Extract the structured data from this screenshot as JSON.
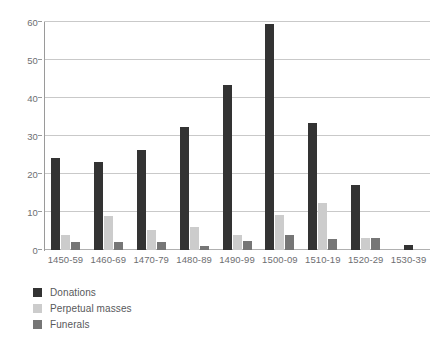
{
  "chart_data": {
    "type": "bar",
    "title": "",
    "subtitle": "",
    "xlabel": "",
    "ylabel": "",
    "categories": [
      "1450-59",
      "1460-69",
      "1470-79",
      "1480-89",
      "1490-99",
      "1500-09",
      "1510-19",
      "1520-29",
      "1530-39"
    ],
    "series": [
      {
        "name": "Donations",
        "color": "#333333",
        "values": [
          24.3,
          23.2,
          26.3,
          32.3,
          43.5,
          59.5,
          33.5,
          17.2,
          1.2
        ]
      },
      {
        "name": "Perpetual masses",
        "color": "#cccccc",
        "values": [
          4.0,
          9.0,
          5.3,
          6.0,
          4.0,
          9.3,
          12.3,
          3.2,
          0
        ]
      },
      {
        "name": "Funerals",
        "color": "#767676",
        "values": [
          2.0,
          2.0,
          2.0,
          1.0,
          2.3,
          4.0,
          3.0,
          3.2,
          0
        ]
      }
    ],
    "ylim": [
      0,
      60
    ],
    "yticks": [
      0,
      10,
      20,
      30,
      40,
      50,
      60
    ],
    "ytick_labels": [
      "0",
      "10",
      "20",
      "30",
      "40",
      "50",
      "60"
    ],
    "grid": "horizontal",
    "legend_position": "bottom-left"
  },
  "colors": {
    "gridline": "#c9c9c9",
    "axis": "#9a9a9a",
    "text": "#6d6e71",
    "background": "#ffffff"
  }
}
